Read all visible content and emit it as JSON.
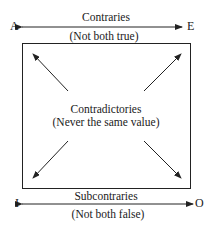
{
  "diagram": {
    "corners": {
      "top_left": "A",
      "top_right": "E",
      "bottom_left": "I",
      "bottom_right": "O"
    },
    "top_relation": {
      "name": "Contraries",
      "note": "(Not both true)"
    },
    "center_relation": {
      "name": "Contradictories",
      "note": "(Never the same value)"
    },
    "bottom_relation": {
      "name": "Subcontraries",
      "note": "(Not both false)"
    },
    "colors": {
      "line": "#222222",
      "text": "#1a1a1a",
      "background": "#ffffff"
    }
  }
}
